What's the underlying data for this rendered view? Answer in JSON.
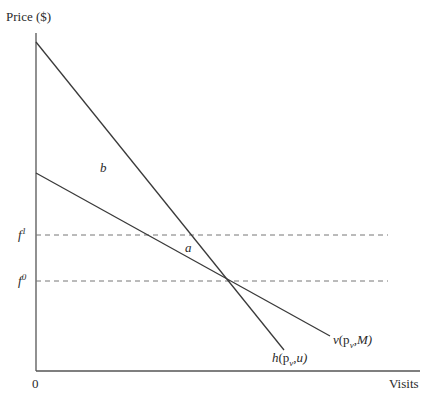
{
  "diagram": {
    "y_axis_label": "Price ($)",
    "x_axis_label": "Visits",
    "origin_label": "0",
    "levels": [
      {
        "name": "f",
        "superscript": "1"
      },
      {
        "name": "f",
        "superscript": "0"
      }
    ],
    "curves": [
      {
        "name": "h",
        "args_pre": "(p",
        "sub": "v",
        "args_post": ",u)",
        "description": "Hicksian demand (steeper)"
      },
      {
        "name": "v",
        "args_pre": "(p",
        "sub": "v",
        "args_post": ",M)",
        "description": "Marshallian demand (flatter)"
      }
    ],
    "regions": [
      {
        "label": "a"
      },
      {
        "label": "b"
      }
    ],
    "colors": {
      "line": "#3a3a3a",
      "dashed": "#777777",
      "axis": "#555555"
    }
  }
}
